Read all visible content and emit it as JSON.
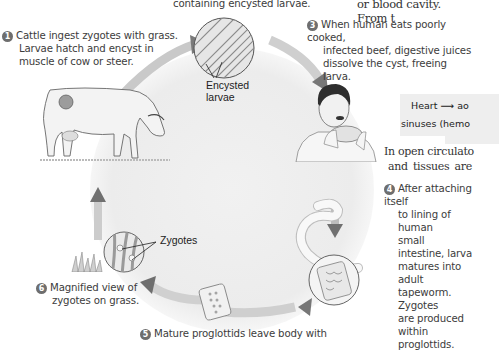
{
  "figure": {
    "top_caption_fragment": "containing encysted larvae.",
    "right_top_fragment": "or blood cavity. From t",
    "steps": [
      {
        "number": "1",
        "text_lines": [
          "Cattle ingest zygotes with grass.",
          "Larvae hatch and encyst in",
          "muscle of cow or steer."
        ]
      },
      {
        "number": "3",
        "text_lines": [
          "When human eats poorly cooked,",
          "infected beef, digestive juices",
          "dissolve the cyst, freeing larva."
        ]
      },
      {
        "number": "4",
        "text_lines": [
          "After attaching itself",
          "to lining of human",
          "small intestine, larva",
          "matures into adult",
          "tapeworm. Zygotes",
          "are produced within",
          "proglottids."
        ]
      },
      {
        "number": "5",
        "text_lines": [
          "Mature proglottids leave body with"
        ]
      },
      {
        "number": "6",
        "text_lines": [
          "Magnified view of",
          "zygotes on grass."
        ]
      }
    ],
    "labels": {
      "encysted_larvae": [
        "Encysted",
        "larvae"
      ],
      "zygotes": "Zygotes"
    },
    "icons": [
      "cow-illustration",
      "muscle-magnified-icon",
      "human-eating-illustration",
      "tapeworm-illustration",
      "proglottid-icon",
      "grass-icon",
      "zygotes-magnified-icon",
      "cycle-arrow-icon"
    ]
  },
  "sidebar_text": {
    "box_line1_prefix": "Heart",
    "box_line1_suffix": "ao",
    "box_line2": "sinuses (hemo",
    "body_line1": "In open circulato",
    "body_line2": "and  tissues  are"
  }
}
